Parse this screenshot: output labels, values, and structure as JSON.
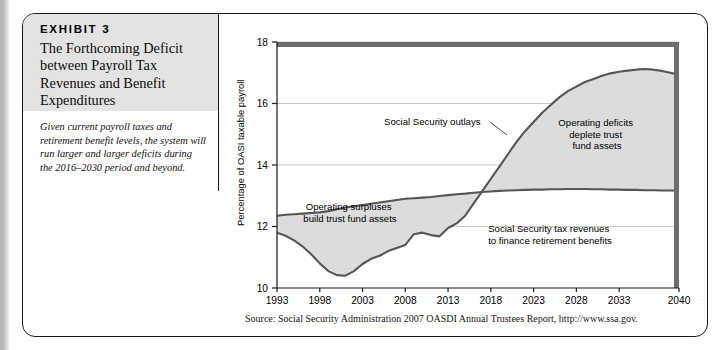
{
  "exhibit": {
    "label": "EXHIBIT 3",
    "title": "The Forthcoming Deficit between Payroll Tax Revenues and Benefit Expenditures",
    "caption": "Given current payroll taxes and retirement benefit levels, the system will run larger and larger deficits during the 2016–2030 period and beyond.",
    "source": "Source: Social Security Administration 2007 OASDI Annual Trustees Report, http://www.ssa.gov."
  },
  "colors": {
    "fill": "#dcdcdc",
    "line": "#555555",
    "frame": "#6e6e6e",
    "grid": "#b0b0b0",
    "header_bg": "#e3e3e3"
  },
  "annotations": {
    "outlays": "Social Security outlays",
    "deficits_line1": "Operating deficits",
    "deficits_line2": "deplete trust",
    "deficits_line3": "fund assets",
    "surplus_line1": "Operating surpluses",
    "surplus_line2": "build trust fund assets",
    "revenues_line1": "Social Security tax revenues",
    "revenues_line2": "to finance retirement benefits"
  },
  "chart_data": {
    "type": "area",
    "title": "",
    "xlabel": "",
    "ylabel": "Percentage of OASI taxable payroll",
    "xlim": [
      1993,
      2040
    ],
    "ylim": [
      10,
      18
    ],
    "yticks": [
      10,
      12,
      14,
      16,
      18
    ],
    "xticks": [
      1993,
      1998,
      2003,
      2008,
      2013,
      2018,
      2023,
      2028,
      2033,
      2040
    ],
    "grid": "horizontal",
    "legend": "none",
    "x": [
      1993,
      1994,
      1995,
      1996,
      1997,
      1998,
      1999,
      2000,
      2001,
      2002,
      2003,
      2004,
      2005,
      2006,
      2007,
      2008,
      2009,
      2010,
      2011,
      2012,
      2013,
      2014,
      2015,
      2016,
      2017,
      2018,
      2019,
      2020,
      2021,
      2022,
      2023,
      2024,
      2025,
      2026,
      2027,
      2028,
      2029,
      2030,
      2031,
      2032,
      2033,
      2034,
      2035,
      2036,
      2037,
      2038,
      2039,
      2040
    ],
    "series": [
      {
        "name": "Social Security outlays",
        "values": [
          11.8,
          11.7,
          11.55,
          11.35,
          11.1,
          10.8,
          10.55,
          10.42,
          10.4,
          10.55,
          10.78,
          10.95,
          11.05,
          11.2,
          11.3,
          11.4,
          11.75,
          11.8,
          11.72,
          11.68,
          11.95,
          12.1,
          12.35,
          12.75,
          13.15,
          13.55,
          13.95,
          14.35,
          14.75,
          15.1,
          15.4,
          15.7,
          15.95,
          16.2,
          16.4,
          16.55,
          16.7,
          16.8,
          16.9,
          16.98,
          17.03,
          17.07,
          17.1,
          17.12,
          17.1,
          17.06,
          17.0,
          16.93
        ]
      },
      {
        "name": "Social Security tax revenues",
        "values": [
          12.35,
          12.38,
          12.4,
          12.42,
          12.44,
          12.46,
          12.5,
          12.56,
          12.62,
          12.66,
          12.7,
          12.74,
          12.78,
          12.82,
          12.86,
          12.9,
          12.92,
          12.94,
          12.96,
          12.99,
          13.02,
          13.05,
          13.07,
          13.1,
          13.12,
          13.14,
          13.16,
          13.17,
          13.18,
          13.19,
          13.2,
          13.2,
          13.21,
          13.21,
          13.22,
          13.22,
          13.22,
          13.21,
          13.21,
          13.2,
          13.2,
          13.19,
          13.19,
          13.18,
          13.18,
          13.17,
          13.17,
          13.16
        ]
      }
    ],
    "crossover_year": 2017
  }
}
